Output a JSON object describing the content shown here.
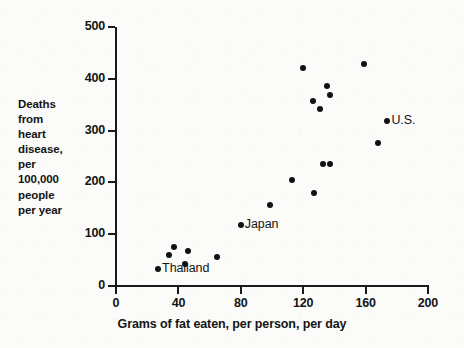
{
  "chart_data": {
    "type": "scatter",
    "title": "",
    "xlabel": "Grams of fat eaten, per person, per day",
    "ylabel": "Deaths from heart disease, per 100,000 people per year",
    "ylabel_lines": [
      "Deaths",
      "from",
      "heart",
      "disease,",
      "per",
      "100,000",
      "people",
      "per year"
    ],
    "xlim": [
      0,
      200
    ],
    "ylim": [
      0,
      500
    ],
    "xticks": [
      0,
      40,
      80,
      120,
      160,
      200
    ],
    "yticks": [
      0,
      100,
      200,
      300,
      400,
      500
    ],
    "xtick_labels": [
      "0",
      "40",
      "80",
      "120",
      "160",
      "200"
    ],
    "ytick_labels": [
      "0",
      "100",
      "200",
      "300",
      "400",
      "500"
    ],
    "grid": false,
    "legend": "none",
    "marker_color": "#111111",
    "axis_color": "#1a1a1a",
    "background_color": "#fbfbfa",
    "points": [
      {
        "x": 27,
        "y": 33,
        "label": "Thailand",
        "label_pos": "right"
      },
      {
        "x": 37,
        "y": 76,
        "label": "",
        "label_pos": ""
      },
      {
        "x": 34,
        "y": 59,
        "label": "",
        "label_pos": ""
      },
      {
        "x": 46,
        "y": 68,
        "label": "",
        "label_pos": ""
      },
      {
        "x": 44,
        "y": 43,
        "label": "",
        "label_pos": ""
      },
      {
        "x": 65,
        "y": 56,
        "label": "",
        "label_pos": ""
      },
      {
        "x": 80,
        "y": 118,
        "label": "Japan",
        "label_pos": "right"
      },
      {
        "x": 99,
        "y": 156,
        "label": "",
        "label_pos": ""
      },
      {
        "x": 113,
        "y": 205,
        "label": "",
        "label_pos": ""
      },
      {
        "x": 127,
        "y": 180,
        "label": "",
        "label_pos": ""
      },
      {
        "x": 133,
        "y": 236,
        "label": "",
        "label_pos": ""
      },
      {
        "x": 137,
        "y": 236,
        "label": "",
        "label_pos": ""
      },
      {
        "x": 120,
        "y": 421,
        "label": "",
        "label_pos": ""
      },
      {
        "x": 126,
        "y": 357,
        "label": "",
        "label_pos": ""
      },
      {
        "x": 131,
        "y": 342,
        "label": "",
        "label_pos": ""
      },
      {
        "x": 135,
        "y": 386,
        "label": "",
        "label_pos": ""
      },
      {
        "x": 137,
        "y": 369,
        "label": "",
        "label_pos": ""
      },
      {
        "x": 159,
        "y": 429,
        "label": "",
        "label_pos": ""
      },
      {
        "x": 168,
        "y": 276,
        "label": "",
        "label_pos": ""
      },
      {
        "x": 174,
        "y": 319,
        "label": "U.S.",
        "label_pos": "right"
      }
    ]
  }
}
